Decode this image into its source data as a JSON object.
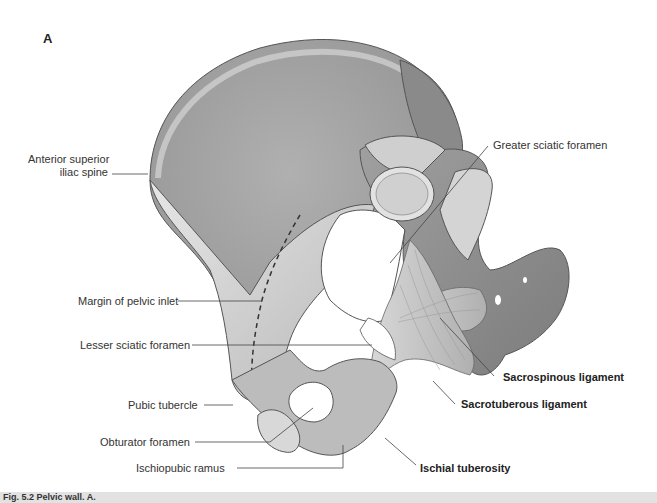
{
  "figure": {
    "panel_letter": "A",
    "labels": {
      "anterior_superior_iliac_spine_l1": "Anterior superior",
      "anterior_superior_iliac_spine_l2": "iliac spine",
      "greater_sciatic_foramen": "Greater sciatic foramen",
      "margin_of_pelvic_inlet": "Margin of pelvic inlet",
      "lesser_sciatic_foramen": "Lesser sciatic foramen",
      "pubic_tubercle": "Pubic tubercle",
      "obturator_foramen": "Obturator foramen",
      "ischiopubic_ramus": "Ischiopubic ramus",
      "sacrospinous_ligament": "Sacrospinous ligament",
      "sacrotuberous_ligament": "Sacrotuberous ligament",
      "ischial_tuberosity": "Ischial tuberosity"
    },
    "caption_partial": "Fig. 5.2 Pelvic wall. A."
  },
  "colors": {
    "bone_light": "#dcdcdc",
    "bone_mid": "#b5b5b5",
    "bone_dark": "#8f8f8f",
    "leader_line": "#444444",
    "caption_bg": "#e2e2e2"
  }
}
